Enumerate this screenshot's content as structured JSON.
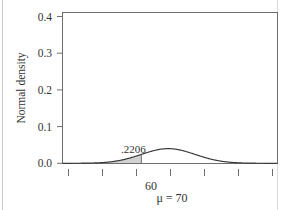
{
  "chart_data": {
    "type": "line",
    "title": "",
    "xlabel": "",
    "ylabel": "Normal density",
    "distribution": "normal",
    "mu": 70,
    "sigma": 10,
    "ylim": [
      0.0,
      0.44
    ],
    "xlim": [
      30.7,
      110.6
    ],
    "grid": false,
    "legend": "none",
    "y_ticks": [
      "0.0",
      "0.1",
      "0.2",
      "0.3",
      "0.4"
    ],
    "y_tick_values": [
      0.0,
      0.1,
      0.2,
      0.3,
      0.4
    ],
    "x_tick_values": [
      40,
      50,
      60,
      70,
      80,
      90,
      100
    ],
    "x_tick_labels": [
      "",
      "",
      "60",
      "",
      "",
      "",
      ""
    ],
    "x_axis_annotation": "μ = 70",
    "x_axis_annotation_value": 70,
    "shaded_region": {
      "from": "-infinity",
      "to": 60,
      "area_label": ".2206",
      "area_value": 0.2206,
      "fill_color": "#d2d2d2"
    },
    "curve_peak_density": 0.4,
    "curve_color": "#3a3a3a",
    "series": [
      {
        "name": "Normal density (mu=70, sigma=10)",
        "x": [
          30.7,
          35,
          40,
          45,
          50,
          55,
          60,
          65,
          70,
          75,
          80,
          85,
          90,
          95,
          100,
          105,
          110.6
        ],
        "values": [
          0.0001,
          0.0009,
          0.0044,
          0.0175,
          0.054,
          0.1295,
          0.242,
          0.3521,
          0.3989,
          0.3521,
          0.242,
          0.1295,
          0.054,
          0.0175,
          0.0044,
          0.0009,
          0.0001
        ]
      }
    ]
  },
  "axes": {
    "y_title": "Normal density",
    "y_tick_0": "0.0",
    "y_tick_1": "0.1",
    "y_tick_2": "0.2",
    "y_tick_3": "0.3",
    "y_tick_4": "0.4",
    "x_tick_60": "60",
    "x_mu_label": "μ = 70"
  },
  "annotations": {
    "area_label": ".2206"
  },
  "colors": {
    "curve": "#3a3a3a",
    "frame": "#6e6e6e",
    "shade": "#d2d2d2",
    "text": "#333333",
    "page_rule": "#c9c9c9"
  }
}
